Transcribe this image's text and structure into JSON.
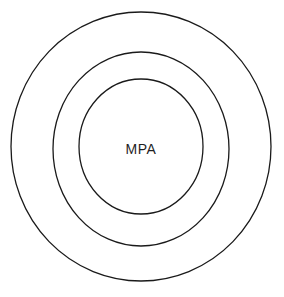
{
  "diagram": {
    "type": "concentric-rings",
    "background_color": "#ffffff",
    "stroke_color": "#1a1a1a",
    "fill_color": "#ffffff",
    "center_label": "MPA",
    "center_label_color": "#1f1f1f",
    "rings": [
      {
        "id": "outer",
        "label": "",
        "cx": 141,
        "cy": 146.5,
        "rx": 130,
        "ry": 134.5,
        "stroke_width": 1.3
      },
      {
        "id": "middle",
        "label": "",
        "cx": 141,
        "cy": 149,
        "rx": 88,
        "ry": 97,
        "stroke_width": 1.3
      },
      {
        "id": "inner",
        "label": "MPA",
        "cx": 141,
        "cy": 146.5,
        "rx": 62,
        "ry": 67.5,
        "stroke_width": 1.3
      }
    ],
    "center_label_x": 141,
    "center_label_y": 150
  }
}
